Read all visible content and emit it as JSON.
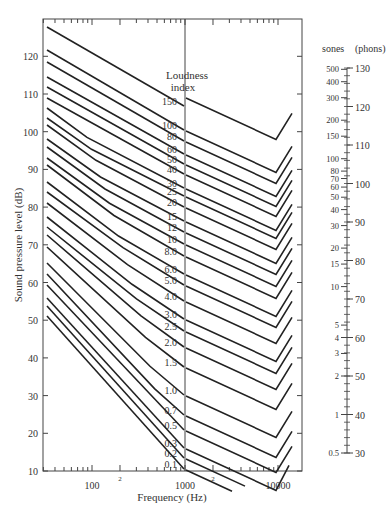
{
  "chart_data": {
    "type": "line",
    "title": "",
    "xlabel": "Frequency (Hz)",
    "ylabel": "Sound pressure level (dB)",
    "xscale": "log",
    "xlim": [
      30,
      18000
    ],
    "ylim": [
      10,
      125
    ],
    "x_ticks": [
      "100",
      "2",
      "1000",
      "2",
      "10000"
    ],
    "y_ticks": [
      10,
      20,
      30,
      40,
      50,
      60,
      70,
      80,
      90,
      100,
      110,
      120
    ],
    "legend_title": "Loudness index",
    "series_labels": [
      "150",
      "100",
      "80",
      "60",
      "50",
      "40",
      "30",
      "25",
      "20",
      "15",
      "12",
      "10",
      "8.0",
      "6.0",
      "5.0",
      "4.0",
      "3.0",
      "2.5",
      "2.0",
      "1.5",
      "1.0",
      "0.7",
      "0.5",
      "0.3",
      "0.2",
      "0.1"
    ],
    "right_scale": {
      "title_left": "sones",
      "title_right": "(phons)",
      "sones": [
        "500",
        "400",
        "300",
        "200",
        "150",
        "100",
        "80",
        "70",
        "60",
        "50",
        "40",
        "30",
        "20",
        "15",
        "10",
        "5",
        "4",
        "3",
        "2",
        "1",
        "0.5"
      ],
      "phons": [
        "130",
        "120",
        "110",
        "100",
        "90",
        "80",
        "70",
        "60",
        "50",
        "40",
        "30"
      ]
    },
    "grid": false
  },
  "labels": {
    "loudness": "Loudness",
    "index": "index",
    "xlabel": "Frequency (Hz)",
    "ylabel": "Sound pressure level (dB)",
    "sones": "sones",
    "phons": "(phons)"
  }
}
